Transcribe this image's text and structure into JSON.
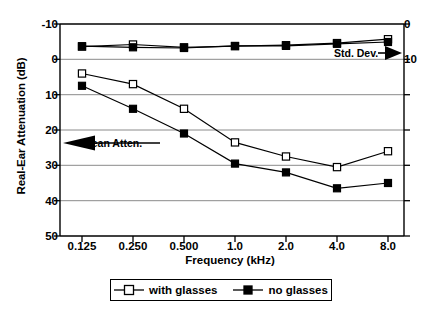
{
  "chart_data": {
    "type": "line",
    "title": "",
    "xlabel": "Frequency (kHz)",
    "ylabel": "Real-Ear Attenuation (dB)",
    "y2label": "",
    "categories": [
      "0.125",
      "0.250",
      "0.500",
      "1.0",
      "2.0",
      "4.0",
      "8.0"
    ],
    "xticklabels": [
      "0.125",
      "0.250",
      "0.500",
      "1.0",
      "2.0",
      "4.0",
      "8.0"
    ],
    "yticklabels": [
      "-10",
      "0",
      "10",
      "20",
      "30",
      "40",
      "50"
    ],
    "ytickvalues": [
      -10,
      0,
      10,
      20,
      30,
      40,
      50
    ],
    "ylim": [
      -10,
      50
    ],
    "y_inverted": true,
    "y2ticklabels": [
      "0",
      "10"
    ],
    "y2tickvalues": [
      0,
      10
    ],
    "y2lim": [
      0,
      10
    ],
    "grid": true,
    "grid_axis": "y",
    "legend_position": "below-axes",
    "series": [
      {
        "name": "with glasses",
        "marker": "open-square",
        "group": "Mean Atten.",
        "axis": "left",
        "values": [
          4.0,
          7.0,
          14.0,
          23.5,
          27.5,
          30.5,
          26.0
        ]
      },
      {
        "name": "no glasses",
        "marker": "filled-square",
        "group": "Mean Atten.",
        "axis": "left",
        "values": [
          7.5,
          14.0,
          21.0,
          29.5,
          32.0,
          36.5,
          35.0
        ]
      },
      {
        "name": "with glasses",
        "marker": "open-square",
        "group": "Std. Dev.",
        "axis": "right",
        "values": [
          6.4,
          5.8,
          6.6,
          6.3,
          6.0,
          5.4,
          4.3
        ]
      },
      {
        "name": "no glasses",
        "marker": "filled-square",
        "group": "Std. Dev.",
        "axis": "right",
        "values": [
          6.3,
          6.6,
          6.8,
          6.2,
          6.2,
          5.6,
          5.1
        ]
      }
    ],
    "annotations": [
      {
        "text": "Mean Atten.",
        "arrow": "left",
        "target_axis": "left"
      },
      {
        "text": "Std. Dev.",
        "arrow": "right",
        "target_axis": "right"
      }
    ]
  },
  "axes": {
    "ylabel": "Real-Ear Attenuation (dB)",
    "xlabel": "Frequency (kHz)",
    "left_ticks": [
      "-10",
      "0",
      "10",
      "20",
      "30",
      "40",
      "50"
    ],
    "right_ticks": [
      "0",
      "10"
    ],
    "x_ticks": [
      "0.125",
      "0.250",
      "0.500",
      "1.0",
      "2.0",
      "4.0",
      "8.0"
    ]
  },
  "annotations": {
    "mean": "Mean Atten.",
    "stddev": "Std. Dev."
  },
  "legend": {
    "items": [
      {
        "label": "with glasses",
        "marker": "open-square"
      },
      {
        "label": "no glasses",
        "marker": "filled-square"
      }
    ]
  },
  "colors": {
    "line": "#000000",
    "grid": "#808080",
    "axis": "#000000",
    "background": "#ffffff",
    "marker_fill_open": "#ffffff",
    "marker_fill_closed": "#000000"
  }
}
